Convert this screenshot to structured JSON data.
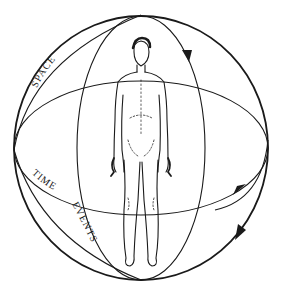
{
  "diagram": {
    "labels": {
      "space": "SPACE",
      "time": "TIME",
      "events": "EVENTS"
    },
    "colors": {
      "stroke": "#1a1a1a",
      "background": "#ffffff"
    },
    "elements": {
      "outer_sphere": "sphere outline",
      "vertical_meridian": "vertical ellipse",
      "horizontal_equator": "horizontal ellipse",
      "figure": "standing human figure",
      "arrows": 3
    }
  }
}
